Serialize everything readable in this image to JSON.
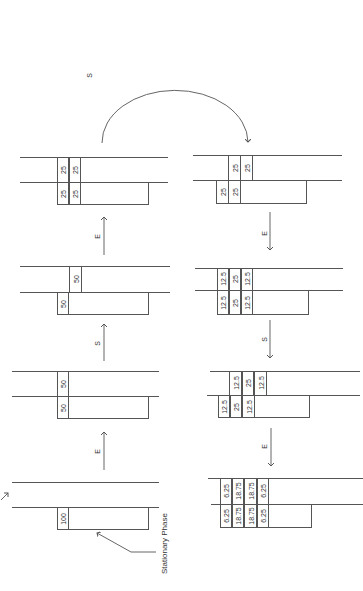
{
  "diagram": {
    "stationary_phase_label": "Stationary Phase",
    "arc_label": "S",
    "panels": [
      {
        "id": "p1",
        "upper": [],
        "lower": [
          "100"
        ]
      },
      {
        "id": "p2",
        "upper": [
          "50"
        ],
        "lower": [
          "50"
        ]
      },
      {
        "id": "p3",
        "upper": [
          "50"
        ],
        "lower": [
          "50"
        ]
      },
      {
        "id": "p4",
        "upper": [
          "25",
          "25"
        ],
        "lower": [
          "25",
          "25"
        ]
      },
      {
        "id": "p5",
        "upper": [
          "25",
          "25"
        ],
        "lower": [
          "25",
          "25"
        ]
      },
      {
        "id": "p6",
        "upper": [
          "12.5",
          "25",
          "12.5"
        ],
        "lower": [
          "12.5",
          "25",
          "12.5"
        ]
      },
      {
        "id": "p7",
        "upper": [
          "12.5",
          "25",
          "12.5"
        ],
        "lower": [
          "12.5",
          "25",
          "12.5"
        ]
      },
      {
        "id": "p8",
        "upper": [
          "6.25",
          "18.75",
          "18.75",
          "6.25"
        ],
        "lower": [
          "6.25",
          "18.75",
          "18.75",
          "6.25"
        ]
      }
    ],
    "transitions": [
      {
        "from": "p1",
        "to": "p2",
        "label": "E"
      },
      {
        "from": "p2",
        "to": "p3",
        "label": "S"
      },
      {
        "from": "p3",
        "to": "p4",
        "label": "E"
      },
      {
        "from": "p4",
        "to": "p5",
        "label": "S"
      },
      {
        "from": "p5",
        "to": "p6",
        "label": "E"
      },
      {
        "from": "p6",
        "to": "p7",
        "label": "S"
      },
      {
        "from": "p7",
        "to": "p8",
        "label": "E"
      }
    ]
  }
}
